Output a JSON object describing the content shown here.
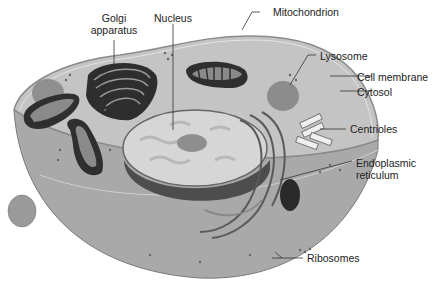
{
  "labels": {
    "golgi_line1": "Golgi",
    "golgi_line2": "apparatus",
    "nucleus": "Nucleus",
    "mitochondrion": "Mitochondrion",
    "lysosome": "Lysosome",
    "cell_membrane": "Cell membrane",
    "cytosol": "Cytosol",
    "centrioles": "Centrioles",
    "er_line1": "Endoplasmic",
    "er_line2": "reticulum",
    "ribosomes": "Ribosomes"
  },
  "colors": {
    "cytosol": "#b9b9b9",
    "cytosol_top": "#c6c6c6",
    "membrane": "#8a8a8a",
    "nucleus_fill": "#d8d8d8",
    "nucleolus": "#8e8e8e",
    "nuclear_wall": "#4a4a4a",
    "organelle_dark": "#2e2e2e",
    "lysosome": "#8c8c8c",
    "leader": "#333333"
  }
}
